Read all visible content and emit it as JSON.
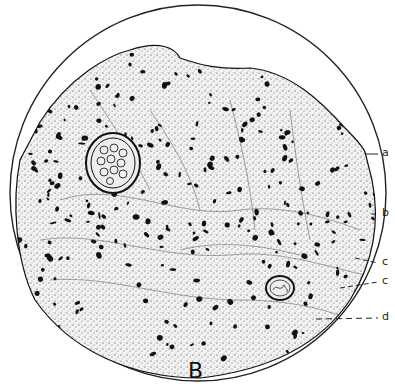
{
  "figure": {
    "caption": "B",
    "colors": {
      "ink": "#111111",
      "background": "#ffffff"
    },
    "labels": [
      {
        "text": "a",
        "x": 383,
        "y": 154
      },
      {
        "text": "b",
        "x": 383,
        "y": 214
      },
      {
        "text": "c",
        "x": 383,
        "y": 262
      },
      {
        "text": "c",
        "x": 383,
        "y": 282
      },
      {
        "text": "d",
        "x": 383,
        "y": 318
      }
    ]
  }
}
